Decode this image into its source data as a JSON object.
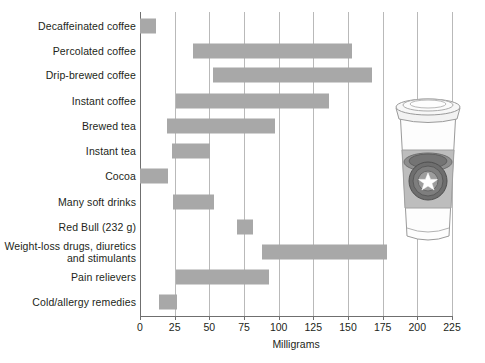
{
  "chart_data": {
    "type": "bar",
    "orientation": "horizontal",
    "subtype": "range-bar",
    "title": "",
    "xlabel": "Milligrams",
    "ylabel": "",
    "xlim": [
      0,
      235
    ],
    "xticks": [
      0,
      25,
      50,
      75,
      100,
      125,
      150,
      175,
      200,
      225
    ],
    "xtick_labels": [
      "0",
      "25",
      "50",
      "75",
      "100",
      "125",
      "150",
      "175",
      "200",
      "225"
    ],
    "grid": "vertical",
    "legend": "none",
    "bar_color": "#a8a8a8",
    "categories": [
      "Decaffeinated coffee",
      "Percolated coffee",
      "Drip-brewed coffee",
      "Instant coffee",
      "Brewed tea",
      "Instant tea",
      "Cocoa",
      "Many soft drinks",
      "Red Bull (232 g)",
      "Weight-loss drugs, diuretics and stimulants",
      "Pain relievers",
      "Cold/allergy remedies"
    ],
    "ranges": [
      {
        "label": "Decaffeinated coffee",
        "low": 0,
        "high": 12
      },
      {
        "label": "Percolated coffee",
        "low": 40,
        "high": 160
      },
      {
        "label": "Drip-brewed coffee",
        "low": 55,
        "high": 175
      },
      {
        "label": "Instant coffee",
        "low": 27,
        "high": 142
      },
      {
        "label": "Brewed tea",
        "low": 20,
        "high": 102
      },
      {
        "label": "Instant tea",
        "low": 24,
        "high": 53
      },
      {
        "label": "Cocoa",
        "low": 0,
        "high": 21
      },
      {
        "label": "Many soft drinks",
        "low": 25,
        "high": 56
      },
      {
        "label": "Red Bull (232 g)",
        "low": 73,
        "high": 85
      },
      {
        "label": "Weight-loss drugs, diuretics and stimulants",
        "low": 92,
        "high": 186
      },
      {
        "label": "Pain relievers",
        "low": 27,
        "high": 97
      },
      {
        "label": "Cold/allergy remedies",
        "low": 14,
        "high": 28
      }
    ]
  },
  "labels": {
    "r0": "Decaffeinated coffee",
    "r1": "Percolated coffee",
    "r2": "Drip-brewed coffee",
    "r3": "Instant coffee",
    "r4": "Brewed tea",
    "r5": "Instant tea",
    "r6": "Cocoa",
    "r7": "Many soft drinks",
    "r8": "Red Bull (232 g)",
    "r9": "Weight-loss drugs, diuretics and stimulants",
    "r10": "Pain relievers",
    "r11": "Cold/allergy remedies"
  },
  "ticks": {
    "t0": "0",
    "t1": "25",
    "t2": "50",
    "t3": "75",
    "t4": "100",
    "t5": "125",
    "t6": "150",
    "t7": "175",
    "t8": "200",
    "t9": "225"
  },
  "axis": {
    "x_title": "Milligrams"
  },
  "illustration": {
    "name": "to-go-coffee-cup",
    "alt": "Paper coffee cup with lid and sleeve bearing a circular star logo"
  }
}
